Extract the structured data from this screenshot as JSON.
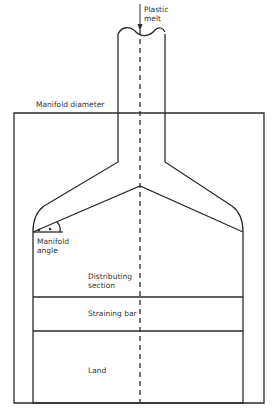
{
  "diagram": {
    "labels": {
      "plastic_melt_line1": "Plastic",
      "plastic_melt_line2": "melt",
      "manifold_diameter": "Manifold diameter",
      "manifold_angle_line1": "Manifold",
      "manifold_angle_line2": "angle",
      "distributing_line1": "Distributing",
      "distributing_line2": "section",
      "straining_bar": "Straining bar",
      "land": "Land"
    },
    "colors": {
      "line": "#2b2b2b",
      "background": "#ffffff",
      "text": "#333333"
    }
  }
}
